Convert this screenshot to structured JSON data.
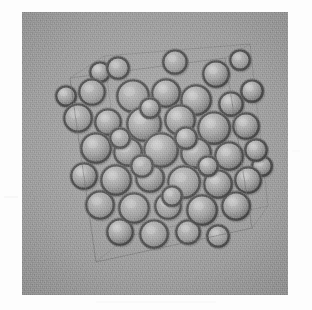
{
  "figure": {
    "kind": "grayscale-render",
    "render_style": "shaded-spheres-wireframe-box",
    "background_color": "#9b9b9b",
    "panel": {
      "x": 22,
      "y": 12,
      "width": 266,
      "height": 283
    },
    "canvas": {
      "width": 312,
      "height": 310
    },
    "margin_color": "#fdfdfd"
  },
  "box": {
    "label": "simulation-cell-wireframe",
    "edge_color": "#6d6d6d",
    "edge_opacity": 0.55,
    "stroke_width": 1.1,
    "description": "tilted cube / parallelepiped outline enclosing the particles",
    "front_face": [
      [
        70,
        78
      ],
      [
        225,
        58
      ],
      [
        252,
        228
      ],
      [
        96,
        262
      ]
    ],
    "back_face": [
      [
        104,
        56
      ],
      [
        250,
        44
      ],
      [
        268,
        206
      ],
      [
        128,
        236
      ]
    ]
  },
  "particles": {
    "label": "sphere-assembly",
    "count": 46,
    "radius_mean_px": 16,
    "radius_min_px": 11,
    "radius_max_px": 20,
    "rim_color": "#3c3c3c",
    "fill_color": "#9d9d9d",
    "highlight_color": "#c9c9c9",
    "list": [
      {
        "cx": 118,
        "cy": 68,
        "r": 12,
        "z": 0.25
      },
      {
        "cx": 175,
        "cy": 62,
        "r": 13,
        "z": 0.22
      },
      {
        "cx": 216,
        "cy": 74,
        "r": 14,
        "z": 0.28
      },
      {
        "cx": 252,
        "cy": 91,
        "r": 12,
        "z": 0.2
      },
      {
        "cx": 92,
        "cy": 92,
        "r": 14,
        "z": 0.35
      },
      {
        "cx": 133,
        "cy": 96,
        "r": 17,
        "z": 0.55
      },
      {
        "cx": 166,
        "cy": 93,
        "r": 15,
        "z": 0.45
      },
      {
        "cx": 196,
        "cy": 100,
        "r": 16,
        "z": 0.5
      },
      {
        "cx": 231,
        "cy": 104,
        "r": 13,
        "z": 0.32
      },
      {
        "cx": 78,
        "cy": 118,
        "r": 15,
        "z": 0.4
      },
      {
        "cx": 108,
        "cy": 122,
        "r": 14,
        "z": 0.42
      },
      {
        "cx": 144,
        "cy": 124,
        "r": 18,
        "z": 0.72
      },
      {
        "cx": 180,
        "cy": 120,
        "r": 16,
        "z": 0.62
      },
      {
        "cx": 214,
        "cy": 128,
        "r": 17,
        "z": 0.58
      },
      {
        "cx": 246,
        "cy": 126,
        "r": 14,
        "z": 0.34
      },
      {
        "cx": 96,
        "cy": 148,
        "r": 16,
        "z": 0.52
      },
      {
        "cx": 128,
        "cy": 152,
        "r": 15,
        "z": 0.6
      },
      {
        "cx": 161,
        "cy": 150,
        "r": 18,
        "z": 0.8
      },
      {
        "cx": 196,
        "cy": 153,
        "r": 16,
        "z": 0.68
      },
      {
        "cx": 229,
        "cy": 156,
        "r": 15,
        "z": 0.48
      },
      {
        "cx": 256,
        "cy": 150,
        "r": 12,
        "z": 0.26
      },
      {
        "cx": 84,
        "cy": 176,
        "r": 14,
        "z": 0.44
      },
      {
        "cx": 116,
        "cy": 180,
        "r": 16,
        "z": 0.66
      },
      {
        "cx": 150,
        "cy": 178,
        "r": 15,
        "z": 0.74
      },
      {
        "cx": 184,
        "cy": 182,
        "r": 17,
        "z": 0.7
      },
      {
        "cx": 218,
        "cy": 184,
        "r": 15,
        "z": 0.54
      },
      {
        "cx": 248,
        "cy": 180,
        "r": 14,
        "z": 0.36
      },
      {
        "cx": 100,
        "cy": 205,
        "r": 15,
        "z": 0.46
      },
      {
        "cx": 134,
        "cy": 208,
        "r": 16,
        "z": 0.64
      },
      {
        "cx": 168,
        "cy": 206,
        "r": 14,
        "z": 0.58
      },
      {
        "cx": 202,
        "cy": 210,
        "r": 16,
        "z": 0.56
      },
      {
        "cx": 236,
        "cy": 206,
        "r": 15,
        "z": 0.38
      },
      {
        "cx": 120,
        "cy": 232,
        "r": 14,
        "z": 0.4
      },
      {
        "cx": 154,
        "cy": 234,
        "r": 15,
        "z": 0.5
      },
      {
        "cx": 188,
        "cy": 232,
        "r": 13,
        "z": 0.42
      },
      {
        "cx": 218,
        "cy": 236,
        "r": 12,
        "z": 0.3
      },
      {
        "cx": 150,
        "cy": 108,
        "r": 11,
        "z": 0.88
      },
      {
        "cx": 186,
        "cy": 138,
        "r": 12,
        "z": 0.86
      },
      {
        "cx": 120,
        "cy": 138,
        "r": 11,
        "z": 0.84
      },
      {
        "cx": 208,
        "cy": 166,
        "r": 11,
        "z": 0.82
      },
      {
        "cx": 142,
        "cy": 166,
        "r": 12,
        "z": 0.9
      },
      {
        "cx": 172,
        "cy": 196,
        "r": 11,
        "z": 0.78
      },
      {
        "cx": 100,
        "cy": 72,
        "r": 11,
        "z": 0.18
      },
      {
        "cx": 240,
        "cy": 60,
        "r": 11,
        "z": 0.16
      },
      {
        "cx": 66,
        "cy": 96,
        "r": 11,
        "z": 0.24
      },
      {
        "cx": 262,
        "cy": 166,
        "r": 11,
        "z": 0.22
      }
    ]
  }
}
